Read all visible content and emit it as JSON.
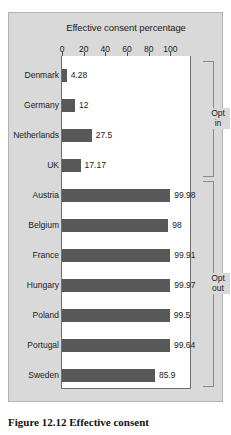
{
  "chart_data": {
    "type": "bar",
    "orientation": "horizontal",
    "title": "Effective consent percentage",
    "xlabel": "",
    "ylabel": "",
    "xlim": [
      0,
      120
    ],
    "xticks": [
      0,
      20,
      40,
      60,
      80,
      100
    ],
    "grid": false,
    "legend": false,
    "bar_color": "#585858",
    "categories": [
      "Denmark",
      "Germany",
      "Netherlands",
      "UK",
      "Austria",
      "Belgium",
      "France",
      "Hungary",
      "Poland",
      "Portugal",
      "Sweden"
    ],
    "values": [
      4.28,
      12,
      27.5,
      17.17,
      99.98,
      98,
      99.91,
      99.97,
      99.5,
      99.64,
      85.9
    ],
    "value_labels": [
      "4.28",
      "12",
      "27.5",
      "17.17",
      "99.98",
      "98",
      "99.91",
      "99.97",
      "99.5",
      "99.64",
      "85.9"
    ],
    "groups": [
      {
        "label": "Opt\nin",
        "label_line1": "Opt",
        "label_line2": "in",
        "categories": [
          "Denmark",
          "Germany",
          "Netherlands",
          "UK"
        ]
      },
      {
        "label": "Opt\nout",
        "label_line1": "Opt",
        "label_line2": "out",
        "categories": [
          "Austria",
          "Belgium",
          "France",
          "Hungary",
          "Poland",
          "Portugal",
          "Sweden"
        ]
      }
    ]
  },
  "caption": {
    "text": "Figure 12.12 Effective consent"
  }
}
